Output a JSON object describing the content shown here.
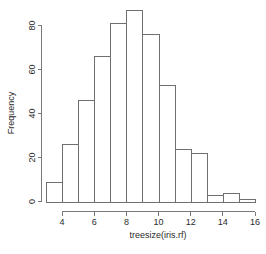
{
  "chart_data": {
    "type": "bar",
    "title": "",
    "subtitle": "",
    "xlabel": "treesize(iris.rf)",
    "ylabel": "Frequency",
    "grid": false,
    "legend": false,
    "bin_edges": [
      3,
      4,
      5,
      6,
      7,
      8,
      9,
      10,
      11,
      12,
      13,
      14,
      15,
      16
    ],
    "categories": [
      "3-4",
      "4-5",
      "5-6",
      "6-7",
      "7-8",
      "8-9",
      "9-10",
      "10-11",
      "11-12",
      "12-13",
      "13-14",
      "14-15",
      "15-16"
    ],
    "values": [
      9,
      26,
      46,
      66,
      81,
      87,
      76,
      53,
      24,
      22,
      3,
      4,
      1
    ],
    "xlim": [
      3,
      16
    ],
    "ylim": [
      0,
      88
    ],
    "xticks": [
      4,
      6,
      8,
      10,
      12,
      14,
      16
    ],
    "xtick_labels": [
      "4",
      "6",
      "8",
      "10",
      "12",
      "14",
      "16"
    ],
    "yticks": [
      0,
      20,
      40,
      60,
      80
    ],
    "ytick_labels": [
      "0",
      "20",
      "40",
      "60",
      "80"
    ],
    "bar_fill_color": "#ffffff",
    "bar_edge_color": "#6f6f6f",
    "axis_color": "#7a7a7a",
    "text_color": "#2b2b2b",
    "background_color": "#ffffff"
  },
  "axes": {
    "y_axis_title": "Frequency",
    "x_axis_title": "treesize(iris.rf)"
  }
}
